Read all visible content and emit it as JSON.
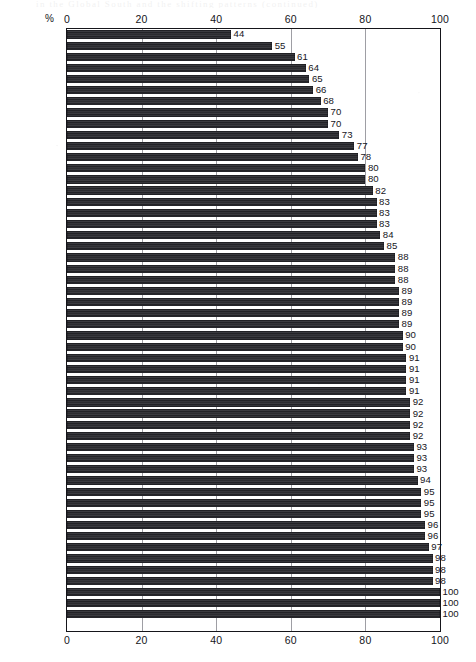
{
  "page": {
    "bleed_text": "in the Global South and the shifting patterns (continued)"
  },
  "chart_data": {
    "type": "bar",
    "orientation": "horizontal",
    "title": "",
    "subtitle": "",
    "xlabel": "%",
    "ylabel": "",
    "xlim": [
      0,
      100
    ],
    "ylim": null,
    "grid": true,
    "grid_axis": "x",
    "legend": null,
    "axis_label_top": "%",
    "tick_labels": [
      "0",
      "20",
      "40",
      "60",
      "80",
      "100"
    ],
    "ticks": [
      0,
      20,
      40,
      60,
      80,
      100
    ],
    "axes_positions": [
      "top",
      "bottom"
    ],
    "value_labels_shown": true,
    "categories": [
      "Venezuela",
      "Uruguay",
      "Nepal",
      "E. Germany",
      "UAE",
      "Romania",
      "Kuwait",
      "Czech'kia",
      "Singapore",
      "Bulgaria",
      "Poland",
      "Oman",
      "Japan",
      "Russia",
      "Hungary",
      "Spain",
      "Turkey",
      "Thailand",
      "Yugoslavia",
      "China",
      "Burkina Faso",
      "Italy",
      "Mexico",
      "Hong Kong",
      "Sweden",
      "Greece",
      "Indonesia",
      "Philippines",
      "Nigeria",
      "Brazil",
      "India",
      "Pakistan",
      "Argentina",
      "USA",
      "Switzerland",
      "Netherlands",
      "W. Germany",
      "Curaçao",
      "Ireland",
      "UK",
      "Austria",
      "France",
      "Egypt",
      "Belgium",
      "Canada",
      "Ethiopia",
      "Norway",
      "Australia",
      "Finland",
      "Portugal",
      "Malaysia",
      "South Africa",
      "Denmark"
    ],
    "values": [
      44,
      55,
      61,
      64,
      65,
      66,
      68,
      70,
      70,
      73,
      77,
      78,
      80,
      80,
      82,
      83,
      83,
      83,
      84,
      85,
      88,
      88,
      88,
      89,
      89,
      89,
      89,
      90,
      90,
      91,
      91,
      91,
      91,
      92,
      92,
      92,
      92,
      93,
      93,
      93,
      94,
      95,
      95,
      95,
      96,
      96,
      97,
      98,
      98,
      98,
      100,
      100,
      100
    ],
    "value_label_texts": [
      "44",
      "55",
      "61",
      "64",
      "65",
      "66",
      "68",
      "70",
      "70",
      "73",
      "77",
      "78",
      "80",
      "80",
      "82",
      "83",
      "83",
      "83",
      "84",
      "85",
      "88",
      "88",
      "88",
      "89",
      "89",
      "89",
      "89",
      "90",
      "90",
      "91",
      "91",
      "91",
      "91",
      "92",
      "92",
      "92",
      "92",
      "93",
      "93",
      "93",
      "94",
      "95",
      "95",
      "95",
      "96",
      "96",
      "97",
      "98",
      "98",
      "98",
      "100",
      "100",
      "100"
    ],
    "colors": {
      "bar": "#2f2f33",
      "axis": "#15151a",
      "grid": "#8d8d94",
      "background": "#ffffff",
      "text": "#15151a"
    }
  }
}
